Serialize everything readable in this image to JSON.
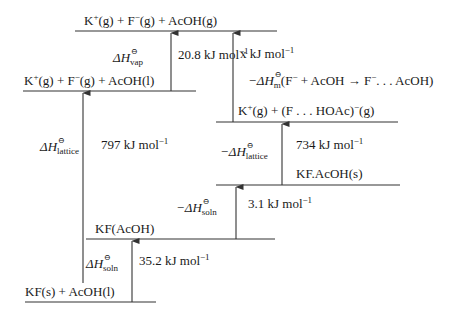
{
  "diagram": {
    "type": "thermochemical-cycle",
    "levels": [
      {
        "id": "top",
        "label_parts": [
          "K",
          "+",
          "(g) + F",
          "−",
          "(g) + AcOH(g)"
        ],
        "y": 31,
        "x1": 75,
        "x2": 277
      },
      {
        "id": "gas-liquid",
        "label_parts": [
          "K",
          "+",
          "(g) + F",
          "−",
          "(g) + AcOH(l)"
        ],
        "y": 91,
        "x1": 23,
        "x2": 196
      },
      {
        "id": "complex-gas",
        "label_parts": [
          "K",
          "+",
          "(g) + (F . . . HOAc)",
          "−",
          "(g)"
        ],
        "y": 122,
        "x1": 216,
        "x2": 398
      },
      {
        "id": "kf-acoh-solid",
        "label": "KF.AcOH(s)",
        "y": 185,
        "x1": 216,
        "x2": 400
      },
      {
        "id": "kf-solution",
        "label": "KF(AcOH)",
        "y": 239,
        "x1": 86,
        "x2": 275
      },
      {
        "id": "bottom",
        "label": "KF(s) + AcOH(l)",
        "y": 302,
        "x1": 25,
        "x2": 156
      }
    ],
    "arrows": [
      {
        "id": "vap",
        "x": 171,
        "from_y": 91,
        "to_y": 31,
        "symbol": "ΔH",
        "sub": "vap",
        "value": "20.8 kJ mol",
        "exp": "−1"
      },
      {
        "id": "x",
        "x": 233,
        "from_y": 122,
        "to_y": 31,
        "value": "x kJ mol",
        "exp": "−1"
      },
      {
        "id": "lattice",
        "x": 83,
        "from_y": 283,
        "to_y": 91,
        "symbol": "ΔH",
        "sub": "lattice",
        "value": "797 kJ mol",
        "exp": "−1"
      },
      {
        "id": "lattice-complex",
        "x": 282,
        "from_y": 185,
        "to_y": 122,
        "symbol": "−ΔH",
        "sub": "lattice",
        "value": "734 kJ mol",
        "exp": "−1"
      },
      {
        "id": "soln-neg",
        "x": 236,
        "from_y": 239,
        "to_y": 185,
        "symbol": "−ΔH",
        "sub": "soln",
        "value": "3.1 kJ mol",
        "exp": "−1"
      },
      {
        "id": "soln",
        "x": 132,
        "from_y": 302,
        "to_y": 239,
        "symbol": "ΔH",
        "sub": "soln",
        "value": "35.2 kJ mol",
        "exp": "−1"
      }
    ],
    "annotation": {
      "prefix": "−ΔH",
      "sub": "m",
      "reaction": "(F",
      "reaction_parts": [
        "(F",
        "−",
        " + AcOH → F",
        "−",
        ". . . AcOH)"
      ]
    },
    "line_color": "#333333",
    "text_color": "#1a1a1a"
  }
}
